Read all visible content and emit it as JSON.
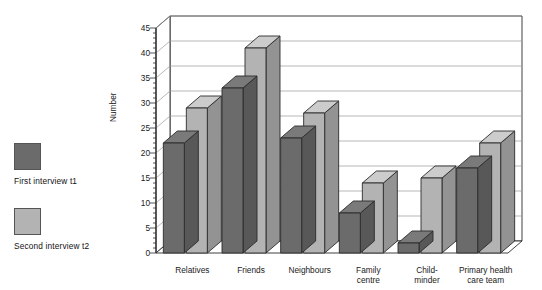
{
  "legend": {
    "items": [
      {
        "label": "First interview t1",
        "color": "#6b6b6b",
        "key": "t1"
      },
      {
        "label": "Second interview t2",
        "color": "#b3b3b3",
        "key": "t2"
      }
    ]
  },
  "chart_data": {
    "type": "bar",
    "title": "",
    "subtitle": "",
    "xlabel": "",
    "ylabel": "Number",
    "ylim": [
      0,
      45
    ],
    "ytick_step": 5,
    "yticks": [
      0,
      5,
      10,
      15,
      20,
      25,
      30,
      35,
      40,
      45
    ],
    "grid": true,
    "grid_axis": "y",
    "legend_position": "left-outside",
    "style": "3d-bar",
    "categories": [
      "Relatives",
      "Friends",
      "Neighbours",
      "Family\ncentre",
      "Child-\nminder",
      "Primary health\ncare team"
    ],
    "series": [
      {
        "name": "First interview t1",
        "color": "#6b6b6b",
        "values": [
          22,
          33,
          23,
          8,
          2,
          17
        ]
      },
      {
        "name": "Second interview t2",
        "color": "#b3b3b3",
        "values": [
          29,
          41,
          28,
          14,
          15,
          22
        ]
      }
    ]
  }
}
